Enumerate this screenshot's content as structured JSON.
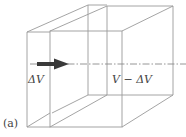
{
  "figure": {
    "panel_label": "(a)",
    "left_label": "ΔV",
    "right_label": "V − ΔV",
    "arrow_direction": "right",
    "colors": {
      "line": "#9a9a9a",
      "arrow": "#3a3a3a",
      "text": "#444444",
      "background": "#ffffff"
    }
  }
}
